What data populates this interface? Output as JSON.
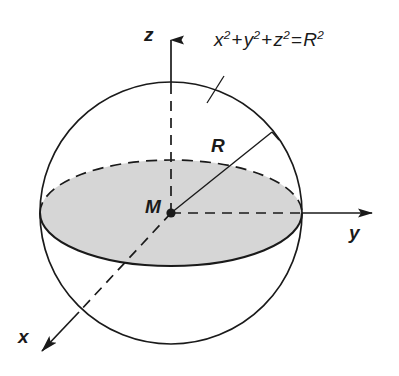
{
  "figure": {
    "labels": {
      "axis_z": "z",
      "axis_y": "y",
      "axis_x": "x",
      "center_point": "M",
      "radius": "R"
    },
    "equation": {
      "full": "x² + y² + z² = R²",
      "term1_base": "x",
      "term1_exp": "2",
      "plus1": "+",
      "term2_base": "y",
      "term2_exp": "2",
      "plus2": "+",
      "term3_base": "z",
      "term3_exp": "2",
      "equals": "=",
      "rhs_base": "R",
      "rhs_exp": "2"
    },
    "colors": {
      "stroke": "#1a1a1a",
      "disk_fill": "#d6d6d6",
      "background": "#ffffff"
    },
    "geometry": {
      "sphere_center_x": 171,
      "sphere_center_y": 213,
      "sphere_radius": 131,
      "disk_semi_major": 131,
      "disk_semi_minor": 53,
      "z_axis_tip_y": 26,
      "y_axis_tip_x": 372,
      "x_axis_tip_x": 38,
      "x_axis_tip_y": 354,
      "radius_end_x": 272,
      "radius_end_y": 132
    }
  }
}
